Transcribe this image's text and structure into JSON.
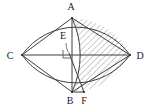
{
  "figure": {
    "background_color": "#ffffff",
    "stroke_color": "#3a3a3a",
    "hatch_color": "#8f8f8f",
    "label_color": "#1a1a1a"
  },
  "points": {
    "A": {
      "label": "A",
      "x": 72,
      "y": 18,
      "label_x": 71,
      "label_y": 10
    },
    "B": {
      "label": "B",
      "x": 72,
      "y": 92,
      "label_x": 70,
      "label_y": 104
    },
    "C": {
      "label": "C",
      "x": 22,
      "y": 55,
      "label_x": 10,
      "label_y": 59
    },
    "D": {
      "label": "D",
      "x": 130,
      "y": 55,
      "label_x": 137,
      "label_y": 59
    },
    "E": {
      "label": "E",
      "x": 69,
      "y": 52,
      "label_x": 63,
      "label_y": 39
    },
    "F": {
      "label": "F",
      "x": 84,
      "y": 92,
      "label_x": 82,
      "label_y": 104
    }
  },
  "segments": [
    {
      "name": "chord-CA",
      "from": "C",
      "to": "A"
    },
    {
      "name": "chord-CB",
      "from": "C",
      "to": "B"
    },
    {
      "name": "chord-AD",
      "from": "A",
      "to": "D"
    },
    {
      "name": "chord-BD",
      "from": "B",
      "to": "D"
    },
    {
      "name": "axis-AB",
      "from": "A",
      "to": "B"
    },
    {
      "name": "axis-CD",
      "from": "C",
      "to": "D"
    },
    {
      "name": "segment-EF",
      "from": "E",
      "to": "F"
    },
    {
      "name": "segment-BF",
      "from": "B",
      "to": "F"
    }
  ],
  "arcs": [
    {
      "name": "arc-upper-CD",
      "from": "C",
      "to": "D",
      "bulge": "up"
    },
    {
      "name": "arc-lower-CD",
      "from": "C",
      "to": "D",
      "bulge": "down"
    },
    {
      "name": "arc-AB",
      "from": "A",
      "to": "B",
      "bulge": "right"
    }
  ],
  "marks": {
    "right_angle": {
      "name": "right-angle-mark",
      "x": 62,
      "y": 50,
      "size": 8
    },
    "leader_line": {
      "name": "leader-line-E",
      "from_x": 66,
      "from_y": 42,
      "to_x": 68,
      "to_y": 51
    }
  },
  "hatching": {
    "name": "hatch-region-ADB",
    "region": "right lens half bounded by arc A-D-B and arc A-B",
    "angle_deg": 45,
    "spacing_px": 3
  }
}
